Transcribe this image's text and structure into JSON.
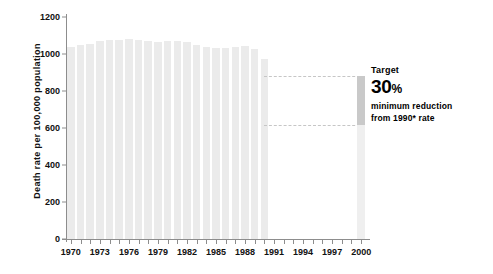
{
  "chart_data": {
    "type": "bar",
    "title": "",
    "xlabel": "",
    "ylabel": "Death rate per 100,000 population",
    "ylim": [
      0,
      1200
    ],
    "yticks": [
      0,
      200,
      400,
      600,
      800,
      1000,
      1200
    ],
    "xlim": [
      1970,
      2000
    ],
    "xticks": [
      1970,
      1973,
      1976,
      1979,
      1982,
      1985,
      1988,
      1991,
      1994,
      1997,
      2000
    ],
    "grid": false,
    "legend": null,
    "bar_color": "#ebebeb",
    "categories": [
      1970,
      1971,
      1972,
      1973,
      1974,
      1975,
      1976,
      1977,
      1978,
      1979,
      1980,
      1981,
      1982,
      1983,
      1984,
      1985,
      1986,
      1987,
      1988,
      1989,
      1990
    ],
    "values": [
      1040,
      1050,
      1055,
      1070,
      1075,
      1075,
      1080,
      1075,
      1070,
      1065,
      1070,
      1070,
      1065,
      1050,
      1040,
      1035,
      1035,
      1040,
      1045,
      1025,
      975
    ],
    "series": [
      {
        "name": "Death rate",
        "values": [
          1040,
          1050,
          1055,
          1070,
          1075,
          1075,
          1080,
          1075,
          1070,
          1065,
          1070,
          1070,
          1065,
          1050,
          1040,
          1035,
          1035,
          1040,
          1045,
          1025,
          975
        ]
      }
    ],
    "annotations": [
      {
        "name": "baseline-1990-rate",
        "type": "dashed-hline",
        "value": 880,
        "from_year": 1990,
        "to_year": 2000
      },
      {
        "name": "target-2000-rate",
        "type": "dashed-hline",
        "value": 616,
        "from_year": 1990,
        "to_year": 2000
      },
      {
        "name": "target-bar",
        "type": "bar",
        "year": 2000,
        "top": 880,
        "band_top": 880,
        "band_bottom": 616,
        "band_color": "#c9c9c9"
      }
    ]
  },
  "annotation": {
    "title": "Target",
    "value": "30",
    "unit": "%",
    "line1": "minimum reduction",
    "line2": "from 1990* rate"
  },
  "colors": {
    "bar": "#ebebeb",
    "target_band": "#c9c9c9",
    "axis": "#8d8d8d",
    "dash": "#c6c6c6",
    "text": "#111111"
  }
}
